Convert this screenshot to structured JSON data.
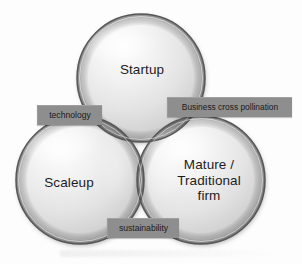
{
  "diagram": {
    "type": "venn",
    "set_count": 3,
    "background_color": "#fdfdfd",
    "circle_fill_color": "#e8e8e8",
    "circle_stroke_color": "#555555",
    "callout_box_color": "#8e8e8e",
    "callout_text_color": "#1b1b1b",
    "circles": [
      {
        "id": "startup",
        "label": "Startup",
        "position": "top",
        "center_x": 141,
        "center_y": 78,
        "radius": 64
      },
      {
        "id": "scaleup",
        "label": "Scaleup",
        "position": "bottom-left",
        "center_x": 80,
        "center_y": 180,
        "radius": 64
      },
      {
        "id": "mature",
        "label": "Mature /\nTraditional\nfirm",
        "position": "bottom-right",
        "center_x": 201,
        "center_y": 180,
        "radius": 64
      }
    ],
    "intersections": [
      {
        "id": "technology",
        "label": "technology",
        "between": [
          "startup",
          "scaleup"
        ]
      },
      {
        "id": "business-cross-pollination",
        "label": "Business cross pollination",
        "between": [
          "startup",
          "mature"
        ]
      },
      {
        "id": "sustainability",
        "label": "sustainability",
        "between": [
          "scaleup",
          "mature"
        ]
      }
    ]
  }
}
